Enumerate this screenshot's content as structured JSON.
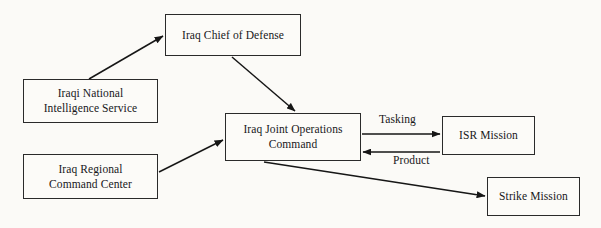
{
  "diagram": {
    "background_color": "#fbfaf7",
    "line_color": "#1a1a1a",
    "nodes": [
      {
        "id": "iraq-chief-of-defense",
        "label": "Iraq Chief of Defense",
        "x": 165,
        "y": 14,
        "width": 136,
        "height": 42
      },
      {
        "id": "iraqi-national-intelligence-service",
        "label": "Iraqi National\nIntelligence Service",
        "x": 23,
        "y": 79,
        "width": 135,
        "height": 44
      },
      {
        "id": "iraq-regional-command-center",
        "label": "Iraq Regional\nCommand Center",
        "x": 23,
        "y": 154,
        "width": 135,
        "height": 45
      },
      {
        "id": "iraq-joint-operations-command",
        "label": "Iraq Joint Operations\nCommand",
        "x": 225,
        "y": 113,
        "width": 136,
        "height": 48
      },
      {
        "id": "isr-mission",
        "label": "ISR Mission",
        "x": 442,
        "y": 116,
        "width": 93,
        "height": 39
      },
      {
        "id": "strike-mission",
        "label": "Strike Mission",
        "x": 487,
        "y": 177,
        "width": 93,
        "height": 39
      }
    ],
    "edges": [
      {
        "id": "inis-to-chief",
        "from": "iraqi-national-intelligence-service",
        "to": "iraq-chief-of-defense",
        "label": ""
      },
      {
        "id": "chief-to-joint-ops",
        "from": "iraq-chief-of-defense",
        "to": "iraq-joint-operations-command",
        "label": ""
      },
      {
        "id": "regional-to-joint-ops",
        "from": "iraq-regional-command-center",
        "to": "iraq-joint-operations-command",
        "label": ""
      },
      {
        "id": "joint-ops-to-isr",
        "from": "iraq-joint-operations-command",
        "to": "isr-mission",
        "label": "Tasking"
      },
      {
        "id": "isr-to-joint-ops",
        "from": "isr-mission",
        "to": "iraq-joint-operations-command",
        "label": "Product"
      },
      {
        "id": "joint-ops-to-strike",
        "from": "iraq-joint-operations-command",
        "to": "strike-mission",
        "label": ""
      }
    ],
    "edge_labels": {
      "tasking": "Tasking",
      "product": "Product"
    }
  }
}
